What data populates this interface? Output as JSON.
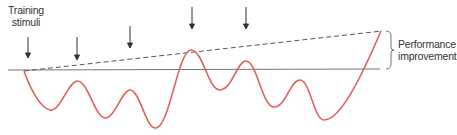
{
  "labels": {
    "training_line1": "Training",
    "training_line2": "stimuli",
    "performance_line1": "Performance",
    "performance_line2": "improvement"
  },
  "colors": {
    "curve": "#e0605a",
    "baseline": "#666666",
    "dashed": "#555555",
    "arrow": "#333333",
    "text": "#333333"
  },
  "diagram": {
    "type": "supercompensation-curve",
    "arrows_x": [
      28,
      77,
      130,
      192,
      246
    ],
    "baseline_y": 70,
    "trend_start": [
      24,
      71
    ],
    "trend_end": [
      382,
      31
    ]
  }
}
